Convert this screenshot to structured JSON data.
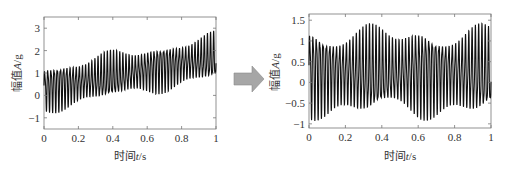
{
  "chart_data": [
    {
      "type": "line",
      "title": "",
      "xlabel": "时间t/s",
      "ylabel": "幅值A/g",
      "xlim": [
        0,
        1
      ],
      "ylim": [
        -1.5,
        3.5
      ],
      "xticks": [
        "0",
        "0.2",
        "0.4",
        "0.6",
        "0.8",
        "1"
      ],
      "yticks": [
        "-1",
        "0",
        "1",
        "2",
        "3"
      ],
      "grid": false,
      "description": "Oscillating vibration signal (~55 cycles) riding on a linear upward trend; center rises from about 0.3 g at t=0 to about 1.7 g at t=1, amplitude about ±1.2 g",
      "series": [
        {
          "name": "signal",
          "trend_start": 0.3,
          "trend_end": 1.7,
          "amplitude": 1.2,
          "cycles": 55
        }
      ]
    },
    {
      "type": "line",
      "title": "",
      "xlabel": "时间t/s",
      "ylabel": "幅值A/g",
      "xlim": [
        0,
        1
      ],
      "ylim": [
        -1.1,
        1.65
      ],
      "xticks": [
        "0",
        "0.2",
        "0.4",
        "0.6",
        "0.8",
        "1"
      ],
      "yticks": [
        "-1",
        "-0.5",
        "0",
        "0.5",
        "1",
        "1.5"
      ],
      "grid": false,
      "description": "Detrended oscillating signal (~55 cycles) centered near 0.2 g, ranging roughly from -0.95 to 1.45 g",
      "series": [
        {
          "name": "signal",
          "trend_start": 0.25,
          "trend_end": 0.25,
          "amplitude": 1.2,
          "cycles": 55
        }
      ]
    }
  ],
  "arrow": {
    "color": "#a6a6a6",
    "direction": "right"
  },
  "labels": {
    "left_xlabel_cn": "时间",
    "left_xlabel_var": "t",
    "left_xlabel_unit": "/s",
    "left_ylabel_cn": "幅值",
    "left_ylabel_var": "A",
    "left_ylabel_unit": "/g",
    "right_xlabel_cn": "时间",
    "right_xlabel_var": "t",
    "right_xlabel_unit": "/s",
    "right_ylabel_cn": "幅值",
    "right_ylabel_var": "A",
    "right_ylabel_unit": "/g"
  }
}
